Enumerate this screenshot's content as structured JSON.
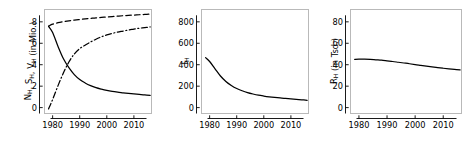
{
  "figure": {
    "panel_count": 3,
    "background_color": "#ffffff",
    "line_color": "#000000",
    "frame_color": "#b9b9b9"
  },
  "chart_data": [
    {
      "type": "line",
      "title": "",
      "xlabel": "",
      "ylabel": "N_H, S_H, V_H (in Mio.)",
      "ylabel_parts": [
        {
          "text": "N",
          "sub": "H"
        },
        {
          "text": ", ",
          "sub": ""
        },
        {
          "text": "S",
          "sub": "H"
        },
        {
          "text": ", ",
          "sub": ""
        },
        {
          "text": "V",
          "sub": "H"
        },
        {
          "text": " (in Mio.)",
          "sub": ""
        }
      ],
      "xlim": [
        1977.0,
        2016.5
      ],
      "ylim": [
        -0.55,
        9.15
      ],
      "xticks": [
        1980,
        1990,
        2000,
        2010
      ],
      "xticklabels": [
        "1980",
        "1990",
        "2000",
        "2010"
      ],
      "yticks": [
        0,
        2,
        4,
        6,
        8
      ],
      "yticklabels": [
        "0",
        "2",
        "4",
        "6",
        "8"
      ],
      "grid": false,
      "legend": "none",
      "x": [
        1978.5,
        1980,
        1982,
        1984,
        1986,
        1988,
        1990,
        1992,
        1994,
        1996,
        1998,
        2000,
        2002,
        2004,
        2006,
        2008,
        2010,
        2012,
        2014,
        2016
      ],
      "series": [
        {
          "name": "N_H",
          "style": "solid",
          "values": [
            7.58,
            7.0,
            5.7,
            4.55,
            3.72,
            3.08,
            2.62,
            2.3,
            2.05,
            1.86,
            1.72,
            1.6,
            1.51,
            1.44,
            1.38,
            1.32,
            1.27,
            1.23,
            1.19,
            1.14
          ]
        },
        {
          "name": "S_H",
          "style": "dashed",
          "values": [
            7.6,
            7.78,
            7.92,
            8.02,
            8.1,
            8.16,
            8.22,
            8.27,
            8.32,
            8.37,
            8.41,
            8.45,
            8.49,
            8.53,
            8.57,
            8.6,
            8.63,
            8.66,
            8.69,
            8.72
          ]
        },
        {
          "name": "V_H",
          "style": "dashdot",
          "values": [
            -0.12,
            0.75,
            2.05,
            3.25,
            4.25,
            5.0,
            5.5,
            5.82,
            6.12,
            6.38,
            6.6,
            6.78,
            6.92,
            7.04,
            7.14,
            7.24,
            7.32,
            7.4,
            7.46,
            7.52
          ]
        }
      ]
    },
    {
      "type": "line",
      "title": "",
      "xlabel": "",
      "ylabel": "I_H",
      "ylabel_parts": [
        {
          "text": "I",
          "sub": "H"
        }
      ],
      "xlim": [
        1977.0,
        2016.5
      ],
      "ylim": [
        -55,
        915
      ],
      "xticks": [
        1980,
        1990,
        2000,
        2010
      ],
      "xticklabels": [
        "1980",
        "1990",
        "2000",
        "2010"
      ],
      "yticks": [
        0,
        200,
        400,
        600,
        800
      ],
      "yticklabels": [
        "0",
        "200",
        "400",
        "600",
        "800"
      ],
      "grid": false,
      "legend": "none",
      "x": [
        1978.5,
        1980,
        1982,
        1984,
        1986,
        1988,
        1990,
        1992,
        1994,
        1996,
        1998,
        2000,
        2002,
        2004,
        2006,
        2008,
        2010,
        2012,
        2014,
        2016
      ],
      "series": [
        {
          "name": "I_H",
          "style": "solid",
          "values": [
            466,
            430,
            362,
            295,
            244,
            207,
            178,
            157,
            140,
            127,
            116,
            108,
            101,
            95,
            90,
            85,
            81,
            77,
            73,
            68
          ]
        }
      ]
    },
    {
      "type": "line",
      "title": "",
      "xlabel": "",
      "ylabel": "R_H (in Tsd.)",
      "ylabel_parts": [
        {
          "text": "R",
          "sub": "H"
        },
        {
          "text": " (in Tsd.)",
          "sub": ""
        }
      ],
      "xlim": [
        1977.0,
        2016.5
      ],
      "ylim": [
        -5.5,
        91.5
      ],
      "xticks": [
        1980,
        1990,
        2000,
        2010
      ],
      "xticklabels": [
        "1980",
        "1990",
        "2000",
        "2010"
      ],
      "yticks": [
        0,
        20,
        40,
        60,
        80
      ],
      "yticklabels": [
        "0",
        "20",
        "40",
        "60",
        "80"
      ],
      "grid": false,
      "legend": "none",
      "x": [
        1978.5,
        1980,
        1982,
        1984,
        1986,
        1988,
        1990,
        1992,
        1994,
        1996,
        1998,
        2000,
        2002,
        2004,
        2006,
        2008,
        2010,
        2012,
        2014,
        2016
      ],
      "series": [
        {
          "name": "R_H",
          "style": "solid",
          "values": [
            45.0,
            45.2,
            45.2,
            45.0,
            44.6,
            44.2,
            43.6,
            43.0,
            42.3,
            41.6,
            40.9,
            40.1,
            39.4,
            38.7,
            38.0,
            37.3,
            36.7,
            36.1,
            35.6,
            35.1
          ]
        }
      ]
    }
  ]
}
